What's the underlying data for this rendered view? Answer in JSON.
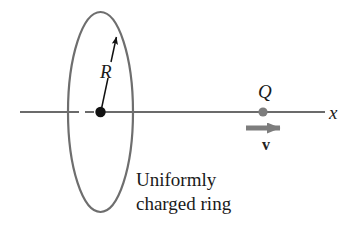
{
  "figure": {
    "kind": "physics-diagram",
    "background_color": "#ffffff",
    "width": 352,
    "height": 231
  },
  "colors": {
    "ring_stroke": "#6e6e6e",
    "axis_line": "#3a3a3a",
    "center_dot": "#111111",
    "charge_dot": "#7d7d7d",
    "velocity_arrow": "#7d7d7d",
    "radius_arrow": "#111111",
    "text": "#1a1a1a"
  },
  "ring": {
    "name": "uniformly charged ring",
    "center_x": 100.5,
    "center_y": 112,
    "rx": 32.5,
    "ry": 100,
    "stroke_width": 2.2
  },
  "axis": {
    "label": "x",
    "y": 112,
    "x_start": 20,
    "x_end": 325,
    "hidden_dash_start": 70,
    "hidden_dash_end": 97
  },
  "radius": {
    "label": "R",
    "from_x": 100,
    "from_y": 112,
    "to_x": 117,
    "to_y": 32
  },
  "charge": {
    "label": "Q",
    "x": 263,
    "y": 112,
    "radius": 4.6
  },
  "velocity": {
    "label": "v",
    "x_start": 246,
    "x_end": 293,
    "y": 128
  },
  "caption": {
    "line1": "Uniformly",
    "line2": "charged ring",
    "text": "Uniformly\ncharged ring"
  },
  "icons": {
    "ring": "ellipse-ring-icon",
    "center_point": "point-dot-icon",
    "charge_point": "charge-dot-icon",
    "radius_arrow": "arrow-up-right-icon",
    "velocity_arrow": "arrow-right-icon"
  }
}
